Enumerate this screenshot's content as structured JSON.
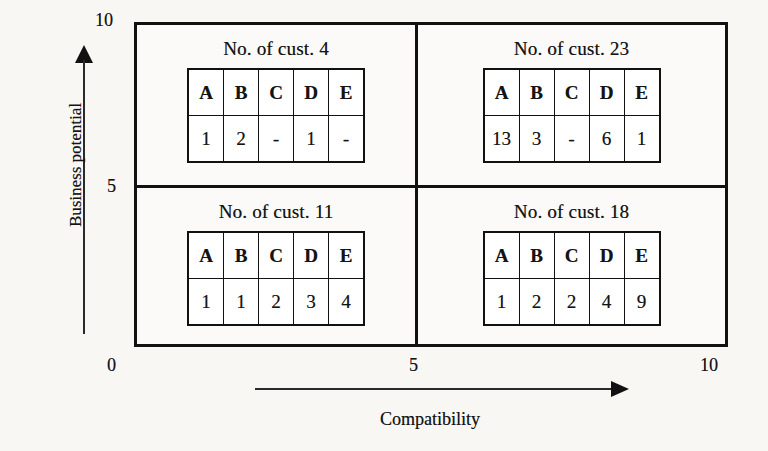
{
  "figure": {
    "type": "quadrant-matrix",
    "background_color": "#f8f7f4",
    "line_color": "#111111"
  },
  "axes": {
    "y": {
      "label": "Business potential",
      "ticks": [
        {
          "value": "10",
          "name": "y-tick-10"
        },
        {
          "value": "5",
          "name": "y-tick-5"
        },
        {
          "value": "0",
          "name": "y-tick-0"
        }
      ]
    },
    "x": {
      "label": "Compatibility",
      "ticks": [
        {
          "value": "0",
          "name": "x-tick-0"
        },
        {
          "value": "5",
          "name": "x-tick-5"
        },
        {
          "value": "10",
          "name": "x-tick-10"
        }
      ]
    }
  },
  "columns": [
    "A",
    "B",
    "C",
    "D",
    "E"
  ],
  "quadrants": {
    "top_left": {
      "title": "No. of cust. 4",
      "headers": [
        "A",
        "B",
        "C",
        "D",
        "E"
      ],
      "values": [
        "1",
        "2",
        "-",
        "1",
        "-"
      ]
    },
    "top_right": {
      "title": "No. of cust. 23",
      "headers": [
        "A",
        "B",
        "C",
        "D",
        "E"
      ],
      "values": [
        "13",
        "3",
        "-",
        "6",
        "1"
      ]
    },
    "bottom_left": {
      "title": "No. of cust. 11",
      "headers": [
        "A",
        "B",
        "C",
        "D",
        "E"
      ],
      "values": [
        "1",
        "1",
        "2",
        "3",
        "4"
      ]
    },
    "bottom_right": {
      "title": "No. of cust. 18",
      "headers": [
        "A",
        "B",
        "C",
        "D",
        "E"
      ],
      "values": [
        "1",
        "2",
        "2",
        "4",
        "9"
      ]
    }
  },
  "chart_data": {
    "type": "table",
    "title": "",
    "xlabel": "Compatibility",
    "ylabel": "Business potential",
    "xlim": [
      0,
      10
    ],
    "ylim": [
      0,
      10
    ],
    "xticks": [
      0,
      5,
      10
    ],
    "yticks": [
      0,
      5,
      10
    ],
    "grid": false,
    "legend": "none",
    "categories": [
      "A",
      "B",
      "C",
      "D",
      "E"
    ],
    "quadrant_cells": [
      {
        "name": "top_left",
        "x_range": [
          0,
          5
        ],
        "y_range": [
          5,
          10
        ],
        "label": "No. of cust. 4",
        "total_customers": 4,
        "values": [
          1,
          2,
          null,
          1,
          null
        ],
        "display_values": [
          "1",
          "2",
          "-",
          "1",
          "-"
        ]
      },
      {
        "name": "top_right",
        "x_range": [
          5,
          10
        ],
        "y_range": [
          5,
          10
        ],
        "label": "No. of cust. 23",
        "total_customers": 23,
        "values": [
          13,
          3,
          null,
          6,
          1
        ],
        "display_values": [
          "13",
          "3",
          "-",
          "6",
          "1"
        ]
      },
      {
        "name": "bottom_left",
        "x_range": [
          0,
          5
        ],
        "y_range": [
          0,
          5
        ],
        "label": "No. of cust. 11",
        "total_customers": 11,
        "values": [
          1,
          1,
          2,
          3,
          4
        ],
        "display_values": [
          "1",
          "1",
          "2",
          "3",
          "4"
        ]
      },
      {
        "name": "bottom_right",
        "x_range": [
          5,
          10
        ],
        "y_range": [
          0,
          5
        ],
        "label": "No. of cust. 18",
        "total_customers": 18,
        "values": [
          1,
          2,
          2,
          4,
          9
        ],
        "display_values": [
          "1",
          "2",
          "2",
          "4",
          "9"
        ]
      }
    ]
  }
}
